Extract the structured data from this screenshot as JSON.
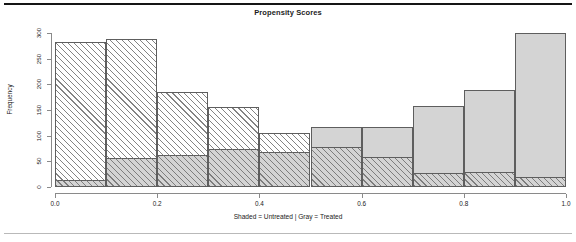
{
  "figure": {
    "title": "Propensity Scores",
    "x_caption": "Shaded = Untreated | Gray = Treated",
    "y_title": "Frequency"
  },
  "chart_data": {
    "type": "bar",
    "subtype": "overlaid-histogram",
    "title": "Propensity Scores",
    "xlabel": "Shaded = Untreated | Gray = Treated",
    "ylabel": "Frequency",
    "xlim": [
      0.0,
      1.0
    ],
    "ylim": [
      0,
      300
    ],
    "grid": false,
    "legend_position": "none",
    "bin_width": 0.1,
    "bin_edges": [
      0.0,
      0.1,
      0.2,
      0.3,
      0.4,
      0.5,
      0.6,
      0.7,
      0.8,
      0.9,
      1.0
    ],
    "categories": [
      "0.0-0.1",
      "0.1-0.2",
      "0.2-0.3",
      "0.3-0.4",
      "0.4-0.5",
      "0.5-0.6",
      "0.6-0.7",
      "0.7-0.8",
      "0.8-0.9",
      "0.9-1.0"
    ],
    "x_tick_labels": [
      "0.0",
      "0.2",
      "0.4",
      "0.6",
      "0.8",
      "1.0"
    ],
    "x_tick_values": [
      0.0,
      0.2,
      0.4,
      0.6,
      0.8,
      1.0
    ],
    "y_tick_labels": [
      "0",
      "50",
      "100",
      "150",
      "200",
      "250",
      "300"
    ],
    "y_tick_values": [
      0,
      50,
      100,
      150,
      200,
      250,
      300
    ],
    "series": [
      {
        "name": "Untreated",
        "style": "shaded-hatch",
        "color": "#ffffff",
        "values": [
          283,
          288,
          186,
          155,
          105,
          78,
          58,
          27,
          29,
          19
        ]
      },
      {
        "name": "Treated",
        "style": "gray-fill",
        "color": "#d4d4d4",
        "values": [
          14,
          56,
          62,
          74,
          68,
          117,
          117,
          158,
          189,
          300
        ]
      }
    ]
  }
}
